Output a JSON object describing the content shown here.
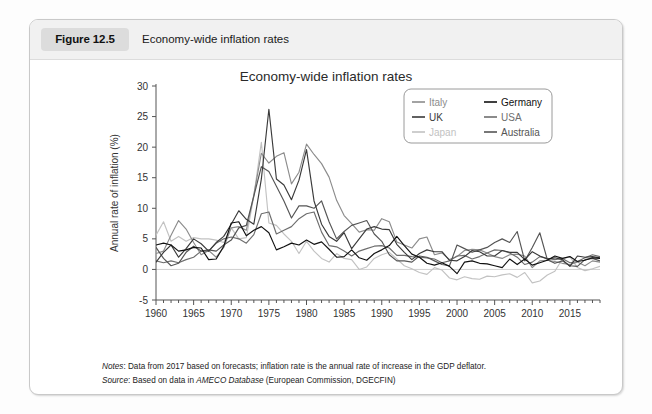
{
  "figure": {
    "badge_label": "Figure 12.5",
    "caption": "Economy-wide inflation rates"
  },
  "chart_title": "Economy-wide inflation rates",
  "notes": {
    "notes_label": "Notes",
    "notes_text": ": Data from 2017 based on forecasts; inflation rate is the annual rate of increase in the GDP deflator.",
    "source_label": "Source",
    "source_text_before": ": Based on data in ",
    "source_em": "AMECO Database",
    "source_text_after": " (European Commission, DGECFIN)"
  },
  "colors": {
    "italy": "#8c8c8c",
    "uk": "#3a3a3a",
    "japan": "#c2c2c2",
    "germany": "#111111",
    "usa": "#6e6e6e",
    "australia": "#555555",
    "axis": "#555555",
    "zero_line": "#d0d0d0",
    "legend_border": "#9a9a9a"
  },
  "legend": {
    "position": "top-right",
    "entries": [
      {
        "label": "Italy",
        "color_key": "italy"
      },
      {
        "label": "Germany",
        "color_key": "germany"
      },
      {
        "label": "UK",
        "color_key": "uk"
      },
      {
        "label": "USA",
        "color_key": "usa"
      },
      {
        "label": "Japan",
        "color_key": "japan"
      },
      {
        "label": "Australia",
        "color_key": "australia"
      }
    ]
  },
  "chart_data": {
    "type": "line",
    "title": "Economy-wide inflation rates",
    "xlabel": "",
    "ylabel": "Annual rate of inflation (%)",
    "xlim": [
      1960,
      2019
    ],
    "ylim": [
      -5,
      30
    ],
    "yticks": [
      -5,
      0,
      5,
      10,
      15,
      20,
      25,
      30
    ],
    "xticks": [
      1960,
      1965,
      1970,
      1975,
      1980,
      1985,
      1990,
      1995,
      2000,
      2005,
      2010,
      2015
    ],
    "minor_xtick_interval": 1,
    "grid": false,
    "zero_line": true,
    "legend_position": "top-right",
    "x": [
      1960,
      1961,
      1962,
      1963,
      1964,
      1965,
      1966,
      1967,
      1968,
      1969,
      1970,
      1971,
      1972,
      1973,
      1974,
      1975,
      1976,
      1977,
      1978,
      1979,
      1980,
      1981,
      1982,
      1983,
      1984,
      1985,
      1986,
      1987,
      1988,
      1989,
      1990,
      1991,
      1992,
      1993,
      1994,
      1995,
      1996,
      1997,
      1998,
      1999,
      2000,
      2001,
      2002,
      2003,
      2004,
      2005,
      2006,
      2007,
      2008,
      2009,
      2010,
      2011,
      2012,
      2013,
      2014,
      2015,
      2016,
      2017,
      2018,
      2019
    ],
    "series": [
      {
        "name": "Italy",
        "values": [
          2.6,
          3.0,
          5.6,
          8.0,
          6.6,
          4.4,
          2.4,
          3.1,
          2.0,
          3.6,
          6.8,
          7.0,
          6.4,
          12.2,
          19.0,
          17.4,
          18.5,
          19.1,
          14.0,
          15.9,
          20.5,
          18.8,
          17.3,
          15.1,
          11.3,
          8.8,
          7.5,
          6.1,
          6.5,
          6.4,
          8.3,
          7.8,
          4.5,
          4.0,
          3.5,
          5.0,
          5.3,
          2.4,
          2.7,
          1.6,
          2.1,
          3.1,
          3.3,
          3.2,
          2.7,
          2.1,
          1.8,
          2.4,
          2.5,
          2.2,
          0.3,
          1.4,
          1.5,
          1.3,
          1.0,
          0.8,
          1.2,
          0.6,
          1.4,
          1.2
        ]
      },
      {
        "name": "Germany",
        "values": [
          4.0,
          4.3,
          4.0,
          3.0,
          3.2,
          3.6,
          3.5,
          1.6,
          1.7,
          3.8,
          7.6,
          7.8,
          5.5,
          6.4,
          7.0,
          6.0,
          3.2,
          3.7,
          4.3,
          4.0,
          4.8,
          4.1,
          4.5,
          3.3,
          2.0,
          2.1,
          3.2,
          1.9,
          1.5,
          2.6,
          3.2,
          3.9,
          5.4,
          3.9,
          2.5,
          2.0,
          1.0,
          0.7,
          1.1,
          0.5,
          -0.7,
          1.2,
          1.4,
          1.0,
          0.9,
          0.6,
          0.3,
          1.7,
          0.8,
          1.7,
          0.7,
          1.1,
          1.5,
          2.2,
          1.8,
          2.1,
          1.3,
          1.5,
          1.9,
          1.8
        ]
      },
      {
        "name": "UK",
        "values": [
          1.2,
          2.8,
          4.0,
          2.0,
          3.4,
          5.0,
          4.2,
          3.0,
          4.4,
          5.4,
          7.4,
          9.6,
          8.2,
          7.4,
          14.8,
          26.2,
          14.8,
          13.8,
          11.4,
          14.6,
          19.6,
          11.2,
          7.4,
          5.4,
          4.6,
          6.0,
          3.4,
          5.0,
          6.6,
          7.0,
          6.6,
          6.5,
          4.1,
          2.8,
          1.6,
          2.6,
          3.2,
          2.9,
          2.9,
          1.5,
          1.4,
          2.1,
          3.1,
          2.9,
          2.2,
          2.2,
          3.1,
          2.8,
          2.8,
          1.6,
          2.9,
          2.2,
          1.7,
          1.9,
          1.6,
          0.5,
          2.2,
          2.0,
          2.1,
          1.9
        ]
      },
      {
        "name": "USA",
        "values": [
          1.4,
          1.1,
          1.4,
          1.1,
          1.6,
          2.0,
          3.0,
          3.0,
          4.3,
          5.0,
          5.3,
          5.0,
          4.3,
          5.7,
          9.1,
          9.4,
          5.8,
          6.4,
          7.0,
          8.3,
          9.1,
          9.4,
          6.1,
          3.9,
          3.7,
          3.0,
          2.2,
          3.0,
          3.4,
          3.8,
          3.9,
          3.5,
          2.3,
          2.3,
          2.1,
          2.0,
          1.9,
          1.7,
          1.1,
          1.4,
          2.2,
          2.3,
          1.7,
          2.1,
          2.7,
          3.2,
          3.1,
          2.7,
          2.0,
          0.8,
          1.2,
          2.1,
          1.8,
          1.6,
          1.8,
          1.1,
          1.3,
          1.9,
          2.4,
          2.1
        ]
      },
      {
        "name": "Japan",
        "values": [
          5.6,
          7.8,
          4.6,
          5.4,
          4.6,
          5.2,
          5.0,
          5.0,
          4.8,
          4.4,
          6.8,
          5.0,
          5.2,
          12.0,
          20.8,
          7.6,
          7.2,
          5.8,
          4.6,
          2.6,
          4.6,
          3.0,
          1.8,
          1.2,
          2.6,
          1.8,
          1.6,
          0.0,
          0.4,
          1.8,
          2.4,
          2.8,
          1.7,
          0.6,
          0.1,
          -0.5,
          -0.8,
          0.3,
          -0.1,
          -1.4,
          -1.7,
          -1.2,
          -1.5,
          -1.6,
          -1.1,
          -1.2,
          -0.9,
          -0.7,
          -1.3,
          -0.5,
          -2.2,
          -1.9,
          -0.9,
          -0.3,
          1.7,
          2.1,
          0.3,
          -0.2,
          0.1,
          0.5
        ]
      },
      {
        "name": "Australia",
        "values": [
          3.6,
          1.8,
          0.6,
          1.0,
          2.8,
          3.8,
          3.0,
          3.2,
          3.0,
          4.0,
          4.8,
          6.8,
          7.2,
          12.0,
          16.8,
          16.0,
          13.6,
          11.2,
          8.4,
          10.4,
          10.4,
          10.0,
          11.2,
          7.8,
          5.0,
          6.2,
          7.2,
          7.6,
          8.0,
          5.8,
          4.6,
          2.4,
          1.4,
          1.4,
          1.2,
          2.2,
          2.0,
          1.4,
          0.8,
          0.6,
          4.0,
          3.4,
          2.8,
          3.2,
          3.6,
          4.4,
          5.0,
          4.4,
          6.2,
          1.4,
          3.6,
          6.0,
          1.6,
          1.0,
          1.4,
          0.6,
          0.5,
          1.6,
          1.8,
          1.4
        ]
      }
    ]
  },
  "axis_labels": {
    "yticks": [
      "30",
      "25",
      "20",
      "15",
      "10",
      "5",
      "0",
      "-5"
    ],
    "xticks": [
      "1960",
      "1965",
      "1970",
      "1975",
      "1980",
      "1985",
      "1990",
      "1995",
      "2000",
      "2005",
      "2010",
      "2015"
    ],
    "ylabel": "Annual rate of inflation (%)"
  }
}
